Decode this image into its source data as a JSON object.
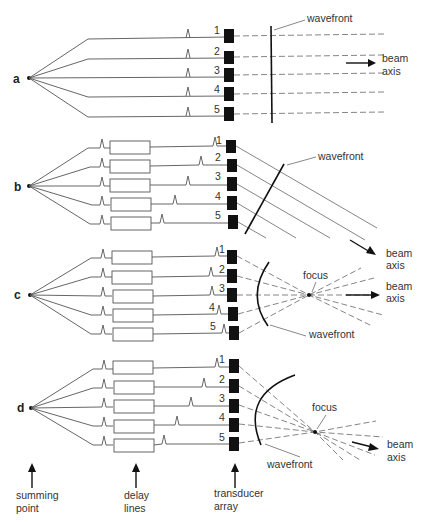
{
  "figure": {
    "panels": [
      {
        "id": "a",
        "label": "a",
        "description": "no delay lines; plane wavefront parallel to array; beam straight ahead",
        "elements": [
          "1",
          "2",
          "3",
          "4",
          "5"
        ],
        "wavefront_label": "wavefront",
        "beam_axis_label": [
          "beam",
          "axis"
        ]
      },
      {
        "id": "b",
        "label": "b",
        "description": "linear delays steer beam; tilted plane wavefront",
        "elements": [
          "1",
          "2",
          "3",
          "4",
          "5"
        ],
        "wavefront_label": "wavefront",
        "beam_axis_label": [
          "beam",
          "axis"
        ]
      },
      {
        "id": "c",
        "label": "c",
        "description": "symmetric curved delays focus beam on axis",
        "elements": [
          "1",
          "2",
          "3",
          "4",
          "5"
        ],
        "focus_label": "focus",
        "wavefront_label": "wavefront",
        "beam_axis_label": [
          "beam",
          "axis"
        ]
      },
      {
        "id": "d",
        "label": "d",
        "description": "combined steering and focusing",
        "elements": [
          "1",
          "2",
          "3",
          "4",
          "5"
        ],
        "focus_label": "focus",
        "wavefront_label": "wavefront",
        "beam_axis_label": [
          "beam",
          "axis"
        ]
      }
    ],
    "bottom_labels": {
      "summing_point": [
        "summing",
        "point"
      ],
      "delay_lines": [
        "delay",
        "lines"
      ],
      "transducer_array": [
        "transducer",
        "array"
      ]
    }
  }
}
